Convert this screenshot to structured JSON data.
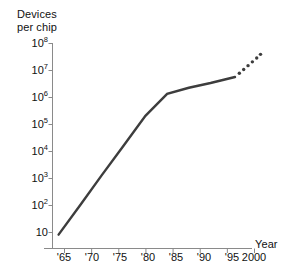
{
  "chart_data": {
    "type": "line",
    "title": "",
    "subtitle": "",
    "ylabel_line1": "Devices",
    "ylabel_line2": "per chip",
    "xlabel": "Year",
    "yscale": "log",
    "ylim": [
      8,
      100000000
    ],
    "xlim": [
      1963,
      2001.5
    ],
    "grid": false,
    "legend": null,
    "y_ticks": [
      {
        "value": 10,
        "mantissa": "10",
        "exponent": ""
      },
      {
        "value": 100,
        "mantissa": "10",
        "exponent": "2"
      },
      {
        "value": 1000,
        "mantissa": "10",
        "exponent": "3"
      },
      {
        "value": 10000,
        "mantissa": "10",
        "exponent": "4"
      },
      {
        "value": 100000,
        "mantissa": "10",
        "exponent": "5"
      },
      {
        "value": 1000000,
        "mantissa": "10",
        "exponent": "6"
      },
      {
        "value": 10000000,
        "mantissa": "10",
        "exponent": "7"
      },
      {
        "value": 100000000,
        "mantissa": "10",
        "exponent": "8"
      }
    ],
    "x_ticks": [
      {
        "value": 1965,
        "label": "'65"
      },
      {
        "value": 1970,
        "label": "'70"
      },
      {
        "value": 1975,
        "label": "'75"
      },
      {
        "value": 1980,
        "label": "'80"
      },
      {
        "value": 1985,
        "label": "'85"
      },
      {
        "value": 1990,
        "label": "'90"
      },
      {
        "value": 1995,
        "label": "'95"
      },
      {
        "value": 2000,
        "label": "2000"
      }
    ],
    "series": [
      {
        "name": "Devices per chip (historical)",
        "style": "solid",
        "color": "#3d3d3d",
        "x": [
          1964,
          1968,
          1972,
          1976,
          1980,
          1984,
          1988,
          1992,
          1996.5
        ],
        "values": [
          8,
          100,
          1300,
          16000,
          200000,
          1300000,
          2200000,
          3300000,
          5500000
        ]
      },
      {
        "name": "Devices per chip (projected)",
        "style": "dotted",
        "color": "#3d3d3d",
        "x": [
          1996.5,
          1997.3,
          1998.1,
          1998.9,
          1999.7,
          2000.5,
          2001.2
        ],
        "values": [
          5500000,
          7600000,
          10500000,
          14500000,
          20000000,
          28000000,
          38000000
        ]
      }
    ],
    "axis_color": "#8a8a8a",
    "line_color": "#3d3d3d"
  }
}
